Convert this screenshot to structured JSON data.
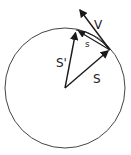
{
  "diagram": {
    "type": "circular-motion-vectors",
    "circle": {
      "cx": 65,
      "cy": 88,
      "r": 60,
      "stroke": "#444444"
    },
    "center": {
      "x": 65,
      "y": 88
    },
    "points": {
      "p1": {
        "x": 110,
        "y": 50
      },
      "p2": {
        "x": 76,
        "y": 30
      }
    },
    "labels": {
      "velocity": "V",
      "chord": "s",
      "position_initial": "S",
      "position_final": "S'"
    },
    "colors": {
      "line": "#1a1a1a",
      "background": "#ffffff"
    }
  }
}
